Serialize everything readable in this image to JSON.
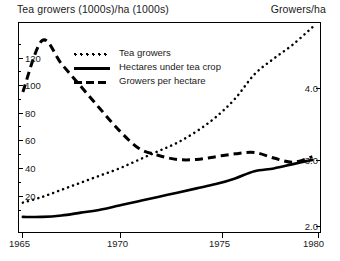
{
  "header": {
    "left_label": "Tea growers (1000s)/ha (1000s)",
    "right_label": "Growers/ha"
  },
  "legend": {
    "items": [
      {
        "label": "Tea growers",
        "style": "dotted"
      },
      {
        "label": "Hectares under tea crop",
        "style": "solid"
      },
      {
        "label": "Growers per hectare",
        "style": "dashed"
      }
    ]
  },
  "axes": {
    "x_ticks": [
      "1965",
      "1970",
      "1975",
      "1980"
    ],
    "y_left_ticks": [
      "20",
      "40",
      "60",
      "80",
      "100",
      "120"
    ],
    "y_right_ticks": [
      "2.0",
      "3.0",
      "4.0"
    ]
  },
  "chart_data": {
    "type": "line",
    "title": "Tea growers (1000s)/ha (1000s)",
    "xlabel": "",
    "ylabel": "Tea growers (1000s)/ha (1000s)",
    "y2label": "Growers/ha",
    "xlim": [
      1964.8,
      1980.5
    ],
    "ylim": [
      0,
      148
    ],
    "y2lim": [
      1.6,
      4.6
    ],
    "grid": false,
    "legend_position": "upper-left-inside",
    "x": [
      1965,
      1966,
      1967,
      1968,
      1969,
      1970,
      1971,
      1972,
      1973,
      1974,
      1975,
      1976,
      1977,
      1978,
      1979,
      1980
    ],
    "series": [
      {
        "name": "Tea growers",
        "axis": "left",
        "style": "dotted",
        "units": "1000s",
        "values": [
          22,
          26,
          31,
          36,
          41,
          46,
          52,
          58,
          64,
          72,
          82,
          95,
          112,
          123,
          133,
          145
        ]
      },
      {
        "name": "Hectares under tea crop",
        "axis": "left",
        "style": "solid",
        "units": "1000s ha",
        "values": [
          12,
          12,
          13,
          15,
          17,
          20,
          23,
          26,
          29,
          32,
          35,
          39,
          44,
          46,
          49,
          52
        ]
      },
      {
        "name": "Growers per hectare",
        "axis": "right",
        "style": "dashed",
        "units": "growers/ha",
        "values": [
          3.62,
          4.35,
          4.02,
          3.7,
          3.38,
          3.07,
          2.82,
          2.72,
          2.66,
          2.66,
          2.7,
          2.74,
          2.76,
          2.68,
          2.62,
          2.7
        ]
      }
    ],
    "annotations": []
  },
  "colors": {
    "ink": "#000000",
    "background": "#ffffff"
  }
}
